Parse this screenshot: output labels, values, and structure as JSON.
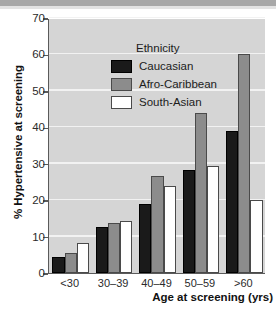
{
  "chart_data": {
    "type": "bar",
    "title": "",
    "subtitle": "",
    "xlabel": "Age at screening (yrs)",
    "ylabel": "% Hypertensive at screening",
    "categories": [
      "<30",
      "30–39",
      "40–49",
      "50–59",
      ">60"
    ],
    "series": [
      {
        "name": "Caucasian",
        "color": "#1a1a1a",
        "values": [
          4.5,
          12.5,
          19.0,
          28.3,
          39.0
        ]
      },
      {
        "name": "Afro-Caribbean",
        "color": "#8c8c8c",
        "values": [
          5.5,
          13.7,
          26.7,
          43.8,
          60.0
        ]
      },
      {
        "name": "South-Asian",
        "color": "#ffffff",
        "values": [
          8.3,
          14.2,
          24.0,
          29.3,
          20.0
        ]
      }
    ],
    "ylim": [
      0,
      70
    ],
    "yticks": [
      0,
      10,
      20,
      30,
      40,
      50,
      60,
      70
    ],
    "ytick_labels": [
      "0",
      "10",
      "20",
      "30",
      "40",
      "50",
      "60",
      "70"
    ],
    "grid": true,
    "grid_axis": "y",
    "legend_title": "Ethnicity",
    "legend_position": "upper-left-inside",
    "legend_entries": [
      {
        "label": "Caucasian",
        "swatch": "black-filled-square"
      },
      {
        "label": "Afro-Caribbean",
        "swatch": "gray-filled-square"
      },
      {
        "label": "South-Asian",
        "swatch": "white-filled-square"
      }
    ],
    "plot_background": "#d5d5d5",
    "figure_background": "#ffffff",
    "gridline_color": "#f2f2f2",
    "axis_color": "#5a5a5a"
  }
}
